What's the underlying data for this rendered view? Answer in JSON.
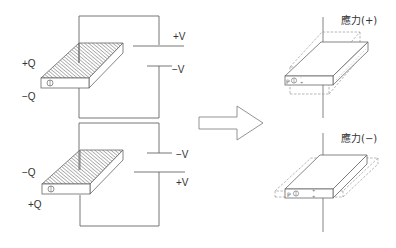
{
  "diagram": {
    "type": "piezoelectric-effect-illustration",
    "colors": {
      "line": "#555555",
      "light_line": "#888888",
      "hatch": "#777777",
      "dashed": "#999999",
      "text": "#333333"
    },
    "left_panel": {
      "top_circuit": {
        "charge_top": "+Q",
        "charge_bottom": "−Q",
        "voltage_top": "+V",
        "voltage_bottom": "−V"
      },
      "bottom_circuit": {
        "charge_top": "−Q",
        "charge_bottom": "+Q",
        "voltage_top": "−V",
        "voltage_bottom": "+V"
      }
    },
    "arrow": {
      "direction": "right"
    },
    "right_panel": {
      "top": {
        "label": "應力(+)",
        "deformation": "expand-thickness"
      },
      "bottom": {
        "label": "應力(−)",
        "deformation": "expand-width"
      }
    }
  }
}
